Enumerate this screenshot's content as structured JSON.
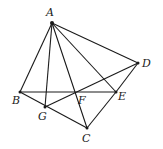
{
  "diagram": {
    "type": "geometry",
    "points": {
      "A": {
        "x": 52,
        "y": 23,
        "label": "A",
        "lx": 46,
        "ly": 16
      },
      "B": {
        "x": 20,
        "y": 92,
        "label": "B",
        "lx": 12,
        "ly": 104
      },
      "G": {
        "x": 45,
        "y": 107,
        "label": "G",
        "lx": 38,
        "ly": 120
      },
      "C": {
        "x": 87,
        "y": 128,
        "label": "C",
        "lx": 82,
        "ly": 142
      },
      "E": {
        "x": 116,
        "y": 92,
        "label": "E",
        "lx": 118,
        "ly": 100
      },
      "D": {
        "x": 138,
        "y": 63,
        "label": "D",
        "lx": 142,
        "ly": 67
      },
      "F": {
        "x": 76,
        "y": 92,
        "label": "F",
        "lx": 78,
        "ly": 104
      }
    },
    "segments": [
      [
        "A",
        "B"
      ],
      [
        "A",
        "G"
      ],
      [
        "A",
        "C"
      ],
      [
        "A",
        "E"
      ],
      [
        "A",
        "D"
      ],
      [
        "B",
        "E"
      ],
      [
        "B",
        "C"
      ],
      [
        "G",
        "D"
      ],
      [
        "C",
        "E"
      ],
      [
        "E",
        "D"
      ]
    ],
    "labels": [
      "A",
      "B",
      "G",
      "C",
      "E",
      "D",
      "F"
    ]
  }
}
